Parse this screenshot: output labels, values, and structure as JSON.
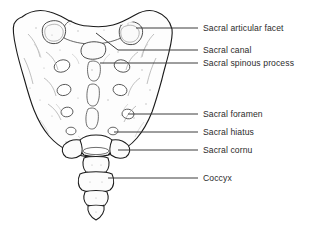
{
  "figure": {
    "type": "anatomical-diagram",
    "background_color": "#ffffff",
    "outline_color": "#1a1a1a",
    "detail_color": "#8c8c8c",
    "leader_color": "#3c3c3c",
    "text_color": "#2b2b2b"
  },
  "labels": [
    {
      "id": "sacral-articular-facet",
      "text": "Sacral articular facet",
      "text_x": 203,
      "text_y": 24,
      "leader": {
        "x1": 198,
        "y1": 28,
        "x2": 149,
        "y2": 28
      },
      "pointer": {
        "x": 149,
        "y": 28
      }
    },
    {
      "id": "sacral-canal",
      "text": "Sacral canal",
      "text_x": 203,
      "text_y": 46,
      "leader": {
        "x1": 198,
        "y1": 50,
        "x2": 156,
        "y2": 50
      },
      "pointer": {
        "x": 110,
        "y": 30
      }
    },
    {
      "id": "sacral-spinous-process",
      "text": "Sacral spinous process",
      "text_x": 203,
      "text_y": 59,
      "leader": {
        "x1": 198,
        "y1": 63,
        "x2": 120,
        "y2": 63
      },
      "pointer": {
        "x": 120,
        "y": 63
      }
    },
    {
      "id": "sacral-foramen",
      "text": "Sacral foramen",
      "text_x": 203,
      "text_y": 110,
      "leader": {
        "x1": 198,
        "y1": 114,
        "x2": 128,
        "y2": 114
      },
      "pointer": {
        "x": 128,
        "y": 114
      }
    },
    {
      "id": "sacral-hiatus",
      "text": "Sacral hiatus",
      "text_x": 203,
      "text_y": 128,
      "leader": {
        "x1": 198,
        "y1": 132,
        "x2": 120,
        "y2": 132
      },
      "pointer": {
        "x": 120,
        "y": 132
      }
    },
    {
      "id": "sacral-cornu",
      "text": "Sacral cornu",
      "text_x": 203,
      "text_y": 146,
      "leader": {
        "x1": 198,
        "y1": 150,
        "x2": 118,
        "y2": 150
      },
      "pointer": {
        "x": 118,
        "y": 150
      }
    },
    {
      "id": "coccyx",
      "text": "Coccyx",
      "text_x": 203,
      "text_y": 174,
      "leader": {
        "x1": 198,
        "y1": 178,
        "x2": 112,
        "y2": 178
      },
      "pointer": {
        "x": 112,
        "y": 178
      }
    }
  ],
  "structures": [
    {
      "id": "sacral-ala-left",
      "name": "Left sacral ala (wing)"
    },
    {
      "id": "sacral-ala-right",
      "name": "Right sacral ala (wing)"
    },
    {
      "id": "superior-articular-facet-left",
      "name": "Left superior articular facet"
    },
    {
      "id": "superior-articular-facet-right",
      "name": "Right superior articular facet"
    },
    {
      "id": "median-sacral-crest",
      "name": "Median sacral crest tubercles"
    },
    {
      "id": "posterior-sacral-foramina",
      "name": "Posterior sacral foramina (4 pairs)"
    },
    {
      "id": "sacral-hiatus-opening",
      "name": "Sacral hiatus opening"
    },
    {
      "id": "cornu-left",
      "name": "Left sacral cornu"
    },
    {
      "id": "cornu-right",
      "name": "Right sacral cornu"
    },
    {
      "id": "coccyx-segments",
      "name": "Coccygeal segments Co1-Co4"
    }
  ]
}
